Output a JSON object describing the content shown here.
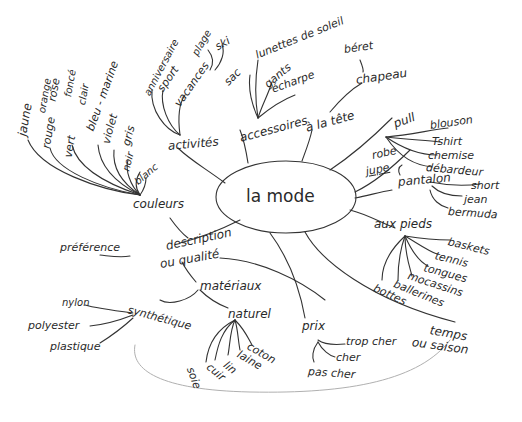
{
  "title": "la mode",
  "branches": {
    "couleurs": {
      "label": "couleurs",
      "items": [
        "jaune",
        "orange",
        "rose",
        "rouge",
        "vert",
        "foncé",
        "clair",
        "bleu - marine",
        "violet",
        "gris",
        "noir",
        "blanc"
      ]
    },
    "activites": {
      "label": "activités",
      "items": [
        "anniversaire",
        "sport",
        "vacances",
        "plage",
        "ski"
      ]
    },
    "accessoires": {
      "label": "accessoires",
      "items": [
        "sac",
        "lunettes de soleil",
        "gants",
        "écharpe"
      ]
    },
    "a_la_tete": {
      "label": "à la tête",
      "items": [
        "chapeau",
        "béret"
      ]
    },
    "pull": {
      "label": "pull",
      "items": [
        "blouson",
        "Tshirt",
        "chemise",
        "débardeur"
      ]
    },
    "robe": {
      "label": "robe",
      "items": [
        "jupe"
      ]
    },
    "pantalon": {
      "label": "pantalon",
      "items": [
        "short",
        "jean",
        "bermuda"
      ]
    },
    "aux_pieds": {
      "label": "aux pieds",
      "items": [
        "baskets",
        "tennis",
        "tongues",
        "mocassins",
        "ballerines",
        "bottes"
      ]
    },
    "temps": {
      "label": "temps",
      "sub": "ou saison"
    },
    "prix": {
      "label": "prix",
      "items": [
        "trop cher",
        "cher",
        "pas cher"
      ]
    },
    "description": {
      "label": "description",
      "sub": "ou qualité",
      "items": [
        "préférence"
      ]
    },
    "materiaux": {
      "label": "matériaux",
      "synthetique": {
        "label": "synthétique",
        "items": [
          "nylon",
          "polyester",
          "plastique"
        ]
      },
      "naturel": {
        "label": "naturel",
        "items": [
          "coton",
          "laine",
          "lin",
          "cuir",
          "soie"
        ]
      }
    }
  }
}
